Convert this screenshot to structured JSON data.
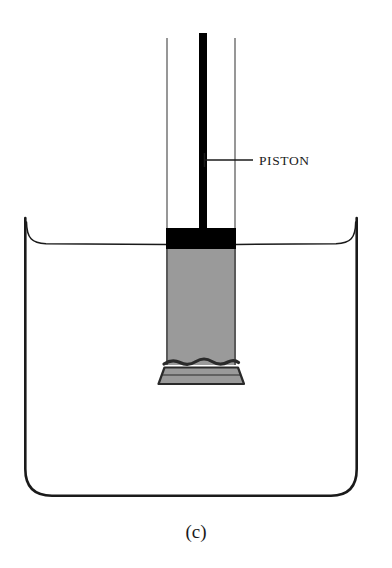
{
  "figure": {
    "caption": "(c)",
    "annotations": [
      {
        "id": "piston-label",
        "text": "PISTON",
        "x": 259,
        "y": 165,
        "leader": {
          "x1": 204,
          "y1": 160,
          "x2": 253,
          "y2": 160,
          "tick_half_height": 7
        }
      }
    ],
    "colors": {
      "outline": "#1a1a1a",
      "tube_wall": "#8c8c8c",
      "piston_head": "#000000",
      "gas_column": "#9a9a9a",
      "gas_column_edge": "#4a4a4a",
      "membrane": "#2a2a2a",
      "background": "#ffffff"
    },
    "parts": {
      "container": {
        "name": "water-container",
        "left": 24,
        "right": 358,
        "top": 218,
        "bottom": 497,
        "corner_radius": 28,
        "stroke_width": 2.6
      },
      "water_surface": {
        "name": "water-surface-line",
        "y": 244,
        "left": 26,
        "right": 356,
        "meniscus_rise": 22,
        "stroke_width": 1.6
      },
      "tube": {
        "name": "glass-tube",
        "left": 166,
        "right": 236,
        "top": 38,
        "stroke_width": 1.8
      },
      "piston_rod": {
        "name": "piston-rod",
        "left": 199,
        "right": 207,
        "top": 33,
        "bottom": 230
      },
      "piston_head": {
        "name": "piston-head",
        "left": 166,
        "right": 236,
        "top": 228,
        "bottom": 249
      },
      "gas_column": {
        "name": "gas-column",
        "left": 166,
        "right": 236,
        "top": 249,
        "bottom": 363
      },
      "membrane": {
        "name": "membrane-wavy-line",
        "y": 363,
        "amplitude": 4,
        "stroke_width": 3
      },
      "bottom_band": {
        "name": "tube-bottom-flared-band",
        "top": 368,
        "bottom": 384,
        "left_top": 164,
        "right_top": 238,
        "left_bottom": 158,
        "right_bottom": 244
      }
    }
  }
}
